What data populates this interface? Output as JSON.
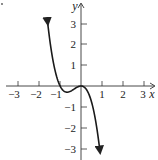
{
  "chart_data": {
    "type": "line",
    "title": "",
    "xlabel": "x",
    "ylabel": "y",
    "xlim": [
      -3.4,
      3.5
    ],
    "ylim": [
      -3.5,
      3.6
    ],
    "grid": false,
    "x_ticks": [
      -3,
      -2,
      -1,
      1,
      2,
      3
    ],
    "y_ticks": [
      3,
      2,
      1,
      -1,
      -2,
      -3
    ],
    "x_tick_labels": [
      "−3",
      "−2",
      "−1",
      "1",
      "2",
      "3"
    ],
    "y_tick_labels": [
      "3",
      "2",
      "1",
      "−1",
      "−2",
      "−3"
    ],
    "series": [
      {
        "name": "f(x)",
        "description": "cubic polynomial with arrows at both ends; x-intercepts at -1 and 0 (touching at 0)",
        "x": [
          -1.6,
          -1.4,
          -1.2,
          -1.0,
          -0.8,
          -0.6,
          -0.5,
          -0.4,
          -0.2,
          0.0,
          0.2,
          0.4,
          0.6,
          0.8,
          0.9
        ],
        "y": [
          3.07,
          1.57,
          0.58,
          0.0,
          -0.26,
          -0.29,
          -0.25,
          -0.19,
          -0.06,
          0.0,
          -0.1,
          -0.45,
          -1.15,
          -2.3,
          -3.08
        ]
      }
    ],
    "color": "#1a1a1a"
  }
}
